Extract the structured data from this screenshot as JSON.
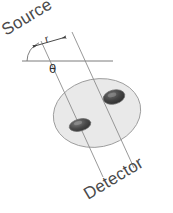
{
  "figure": {
    "title_text": "",
    "background_color": "#ffffff",
    "labels": {
      "source": "Source",
      "detector": "Detector",
      "radius": "r",
      "angle": "θ"
    },
    "colors": {
      "disk_fill": "#e9e9e9",
      "disk_stroke": "#9a9a9a",
      "spot_fill_dark": "#3d3d3d",
      "spot_fill_mid": "#6e6e6e",
      "ray_stroke": "#8c8c8c",
      "axis_stroke": "#7d7d7d",
      "text_color": "#4a4a4a"
    },
    "geometry": {
      "source_label_rotation_deg": -31,
      "detector_label_rotation_deg": -31,
      "ray_angle_from_horizontal_deg": 68,
      "horizontal_line": {
        "x1": 22,
        "y1": 61,
        "x2": 113,
        "y2": 61
      },
      "ray_left": {
        "x1": 41,
        "y1": 41,
        "x2": 103,
        "y2": 177
      },
      "ray_right": {
        "x1": 72,
        "y1": 32,
        "x2": 134,
        "y2": 168
      },
      "dimension_r": {
        "x1": 33,
        "y1": 46,
        "x2": 66,
        "y2": 37
      },
      "disk": {
        "cx": 97,
        "cy": 113,
        "rx": 44,
        "ry": 34,
        "rotation_deg": -11
      },
      "spot_lower_left": {
        "cx": 80,
        "cy": 125,
        "rx": 11,
        "ry": 6,
        "rotation_deg": -14
      },
      "spot_upper_right": {
        "cx": 114,
        "cy": 97,
        "rx": 11,
        "ry": 7,
        "rotation_deg": -14
      },
      "angle_arc": {
        "cx": 47,
        "cy": 61,
        "radius": 20,
        "start_deg": 180,
        "end_deg": 245
      }
    }
  }
}
